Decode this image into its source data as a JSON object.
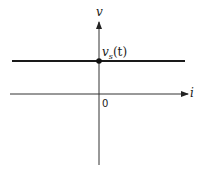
{
  "diagram": {
    "type": "v-i characteristic",
    "axes": {
      "vertical_label": "v",
      "horizontal_label": "i",
      "origin_label": "0"
    },
    "curve": {
      "description": "horizontal line (ideal voltage source)",
      "label_main": "v",
      "label_sub": "s",
      "label_arg": "(t)"
    },
    "colors": {
      "line": "#1a1a1a",
      "axis": "#333333"
    }
  }
}
